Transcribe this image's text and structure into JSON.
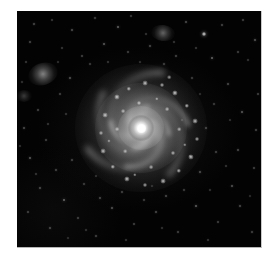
{
  "image": {
    "kind": "astronomical-photograph",
    "subject": "face-on grand-design spiral galaxy",
    "color_mode": "grayscale",
    "caption": "",
    "frame": {
      "left": 17,
      "top": 11,
      "width": 245,
      "height": 237
    },
    "colors": {
      "page_background": "#ffffff",
      "sky_background": "#030303",
      "frame_border": "#c9c9c9",
      "galaxy_light": "#d8d8d8",
      "nucleus": "#ffffff",
      "star": "#ffffff"
    }
  },
  "galaxy": {
    "label": "spiral-galaxy",
    "center": {
      "x": 124,
      "y": 117
    },
    "nucleus_brightness": 1.0,
    "arm_count": 6,
    "winding_direction": "counterclockwise",
    "radius_px": 66,
    "arms": [
      {
        "name": "arm-1",
        "rotation": 8,
        "w": 116,
        "h": 112,
        "thickness": 5.0,
        "opacity": 0.5,
        "sweep": 150,
        "blur": 3.0
      },
      {
        "name": "arm-2",
        "rotation": 72,
        "w": 104,
        "h": 100,
        "thickness": 4.6,
        "opacity": 0.46,
        "sweep": 150,
        "blur": 3.0
      },
      {
        "name": "arm-3",
        "rotation": 140,
        "w": 120,
        "h": 114,
        "thickness": 5.2,
        "opacity": 0.48,
        "sweep": 150,
        "blur": 3.2
      },
      {
        "name": "arm-4",
        "rotation": 205,
        "w": 96,
        "h": 92,
        "thickness": 4.4,
        "opacity": 0.5,
        "sweep": 150,
        "blur": 2.8
      },
      {
        "name": "arm-5",
        "rotation": 268,
        "w": 110,
        "h": 106,
        "thickness": 4.8,
        "opacity": 0.44,
        "sweep": 150,
        "blur": 3.0
      },
      {
        "name": "arm-6",
        "rotation": 320,
        "w": 84,
        "h": 80,
        "thickness": 4.0,
        "opacity": 0.52,
        "sweep": 150,
        "blur": 2.6
      },
      {
        "name": "arm-inner-1",
        "rotation": 30,
        "w": 62,
        "h": 58,
        "thickness": 3.6,
        "opacity": 0.55,
        "sweep": 160,
        "blur": 2.2
      },
      {
        "name": "arm-inner-2",
        "rotation": 212,
        "w": 58,
        "h": 54,
        "thickness": 3.4,
        "opacity": 0.55,
        "sweep": 160,
        "blur": 2.2
      },
      {
        "name": "arm-inner-3",
        "rotation": 118,
        "w": 46,
        "h": 42,
        "thickness": 3.0,
        "opacity": 0.5,
        "sweep": 170,
        "blur": 1.9
      },
      {
        "name": "arm-inner-4",
        "rotation": 300,
        "w": 42,
        "h": 39,
        "thickness": 2.8,
        "opacity": 0.5,
        "sweep": 170,
        "blur": 1.9
      }
    ],
    "knots": [
      {
        "x": 100,
        "y": 86,
        "r": 2.6,
        "b": 0.8
      },
      {
        "x": 112,
        "y": 78,
        "r": 2.2,
        "b": 0.72
      },
      {
        "x": 128,
        "y": 72,
        "r": 2.4,
        "b": 0.78
      },
      {
        "x": 145,
        "y": 74,
        "r": 2.0,
        "b": 0.7
      },
      {
        "x": 158,
        "y": 82,
        "r": 2.6,
        "b": 0.82
      },
      {
        "x": 170,
        "y": 95,
        "r": 2.2,
        "b": 0.74
      },
      {
        "x": 178,
        "y": 110,
        "r": 2.4,
        "b": 0.76
      },
      {
        "x": 180,
        "y": 128,
        "r": 2.0,
        "b": 0.68
      },
      {
        "x": 174,
        "y": 146,
        "r": 2.6,
        "b": 0.78
      },
      {
        "x": 162,
        "y": 160,
        "r": 2.2,
        "b": 0.72
      },
      {
        "x": 146,
        "y": 170,
        "r": 2.4,
        "b": 0.76
      },
      {
        "x": 128,
        "y": 174,
        "r": 2.0,
        "b": 0.68
      },
      {
        "x": 110,
        "y": 168,
        "r": 2.6,
        "b": 0.8
      },
      {
        "x": 96,
        "y": 156,
        "r": 2.2,
        "b": 0.72
      },
      {
        "x": 86,
        "y": 140,
        "r": 2.4,
        "b": 0.74
      },
      {
        "x": 84,
        "y": 122,
        "r": 2.0,
        "b": 0.66
      },
      {
        "x": 88,
        "y": 104,
        "r": 2.4,
        "b": 0.76
      },
      {
        "x": 106,
        "y": 100,
        "r": 1.9,
        "b": 0.66
      },
      {
        "x": 122,
        "y": 92,
        "r": 2.0,
        "b": 0.7
      },
      {
        "x": 150,
        "y": 98,
        "r": 1.9,
        "b": 0.66
      },
      {
        "x": 162,
        "y": 118,
        "r": 1.8,
        "b": 0.64
      },
      {
        "x": 156,
        "y": 142,
        "r": 2.0,
        "b": 0.68
      },
      {
        "x": 134,
        "y": 156,
        "r": 1.9,
        "b": 0.66
      },
      {
        "x": 108,
        "y": 140,
        "r": 1.8,
        "b": 0.62
      },
      {
        "x": 100,
        "y": 118,
        "r": 1.9,
        "b": 0.64
      },
      {
        "x": 140,
        "y": 88,
        "r": 1.7,
        "b": 0.62
      },
      {
        "x": 168,
        "y": 134,
        "r": 1.7,
        "b": 0.6
      },
      {
        "x": 118,
        "y": 164,
        "r": 1.7,
        "b": 0.62
      },
      {
        "x": 92,
        "y": 130,
        "r": 1.6,
        "b": 0.58
      },
      {
        "x": 152,
        "y": 66,
        "r": 1.8,
        "b": 0.62
      }
    ]
  },
  "companions": [
    {
      "name": "fuzzy-galaxy-upper-left",
      "x": 43,
      "y": 74,
      "w": 30,
      "h": 22,
      "opacity": 0.5,
      "rotation": -18
    },
    {
      "name": "fuzzy-galaxy-top",
      "x": 163,
      "y": 33,
      "w": 24,
      "h": 16,
      "opacity": 0.38,
      "rotation": 8
    },
    {
      "name": "fuzzy-patch-left-edge",
      "x": 24,
      "y": 96,
      "w": 16,
      "h": 12,
      "opacity": 0.22,
      "rotation": 0
    }
  ],
  "stars": [
    {
      "x": 34,
      "y": 24,
      "r": 0.9,
      "b": 0.55
    },
    {
      "x": 52,
      "y": 20,
      "r": 0.7,
      "b": 0.4
    },
    {
      "x": 72,
      "y": 30,
      "r": 1.0,
      "b": 0.6
    },
    {
      "x": 95,
      "y": 18,
      "r": 0.8,
      "b": 0.48
    },
    {
      "x": 118,
      "y": 27,
      "r": 1.3,
      "b": 0.78
    },
    {
      "x": 131,
      "y": 16,
      "r": 0.7,
      "b": 0.42
    },
    {
      "x": 186,
      "y": 22,
      "r": 1.0,
      "b": 0.6
    },
    {
      "x": 204,
      "y": 34,
      "r": 1.6,
      "b": 0.88
    },
    {
      "x": 222,
      "y": 25,
      "r": 0.9,
      "b": 0.52
    },
    {
      "x": 243,
      "y": 20,
      "r": 0.8,
      "b": 0.46
    },
    {
      "x": 255,
      "y": 40,
      "r": 1.1,
      "b": 0.66
    },
    {
      "x": 238,
      "y": 52,
      "r": 0.8,
      "b": 0.46
    },
    {
      "x": 212,
      "y": 58,
      "r": 1.4,
      "b": 0.8
    },
    {
      "x": 196,
      "y": 48,
      "r": 0.7,
      "b": 0.4
    },
    {
      "x": 176,
      "y": 56,
      "r": 0.9,
      "b": 0.52
    },
    {
      "x": 150,
      "y": 46,
      "r": 1.0,
      "b": 0.58
    },
    {
      "x": 128,
      "y": 52,
      "r": 0.8,
      "b": 0.46
    },
    {
      "x": 104,
      "y": 44,
      "r": 1.2,
      "b": 0.7
    },
    {
      "x": 82,
      "y": 56,
      "r": 0.8,
      "b": 0.46
    },
    {
      "x": 62,
      "y": 48,
      "r": 0.7,
      "b": 0.4
    },
    {
      "x": 30,
      "y": 42,
      "r": 1.0,
      "b": 0.56
    },
    {
      "x": 26,
      "y": 62,
      "r": 0.7,
      "b": 0.4
    },
    {
      "x": 70,
      "y": 78,
      "r": 1.1,
      "b": 0.64
    },
    {
      "x": 60,
      "y": 94,
      "r": 0.8,
      "b": 0.46
    },
    {
      "x": 38,
      "y": 110,
      "r": 0.9,
      "b": 0.52
    },
    {
      "x": 24,
      "y": 128,
      "r": 1.0,
      "b": 0.58
    },
    {
      "x": 46,
      "y": 140,
      "r": 0.8,
      "b": 0.46
    },
    {
      "x": 30,
      "y": 158,
      "r": 1.2,
      "b": 0.7
    },
    {
      "x": 56,
      "y": 170,
      "r": 0.9,
      "b": 0.52
    },
    {
      "x": 40,
      "y": 188,
      "r": 1.0,
      "b": 0.58
    },
    {
      "x": 64,
      "y": 200,
      "r": 1.4,
      "b": 0.8
    },
    {
      "x": 28,
      "y": 212,
      "r": 0.8,
      "b": 0.46
    },
    {
      "x": 50,
      "y": 228,
      "r": 1.0,
      "b": 0.56
    },
    {
      "x": 78,
      "y": 218,
      "r": 0.8,
      "b": 0.46
    },
    {
      "x": 96,
      "y": 236,
      "r": 0.9,
      "b": 0.5
    },
    {
      "x": 112,
      "y": 208,
      "r": 1.1,
      "b": 0.64
    },
    {
      "x": 134,
      "y": 224,
      "r": 0.8,
      "b": 0.46
    },
    {
      "x": 156,
      "y": 212,
      "r": 1.0,
      "b": 0.58
    },
    {
      "x": 178,
      "y": 232,
      "r": 0.9,
      "b": 0.5
    },
    {
      "x": 196,
      "y": 206,
      "r": 1.3,
      "b": 0.76
    },
    {
      "x": 218,
      "y": 222,
      "r": 0.8,
      "b": 0.46
    },
    {
      "x": 240,
      "y": 206,
      "r": 1.0,
      "b": 0.58
    },
    {
      "x": 252,
      "y": 232,
      "r": 0.9,
      "b": 0.5
    },
    {
      "x": 232,
      "y": 186,
      "r": 1.1,
      "b": 0.64
    },
    {
      "x": 254,
      "y": 168,
      "r": 0.8,
      "b": 0.46
    },
    {
      "x": 238,
      "y": 150,
      "r": 1.0,
      "b": 0.58
    },
    {
      "x": 256,
      "y": 130,
      "r": 0.9,
      "b": 0.52
    },
    {
      "x": 242,
      "y": 112,
      "r": 1.2,
      "b": 0.7
    },
    {
      "x": 258,
      "y": 94,
      "r": 0.8,
      "b": 0.46
    },
    {
      "x": 228,
      "y": 84,
      "r": 1.0,
      "b": 0.58
    },
    {
      "x": 214,
      "y": 104,
      "r": 0.8,
      "b": 0.44
    },
    {
      "x": 206,
      "y": 128,
      "r": 1.0,
      "b": 0.56
    },
    {
      "x": 216,
      "y": 152,
      "r": 0.9,
      "b": 0.5
    },
    {
      "x": 200,
      "y": 172,
      "r": 1.1,
      "b": 0.62
    },
    {
      "x": 184,
      "y": 190,
      "r": 0.8,
      "b": 0.44
    },
    {
      "x": 166,
      "y": 196,
      "r": 1.0,
      "b": 0.56
    },
    {
      "x": 144,
      "y": 200,
      "r": 0.8,
      "b": 0.44
    },
    {
      "x": 122,
      "y": 192,
      "r": 0.9,
      "b": 0.5
    },
    {
      "x": 100,
      "y": 198,
      "r": 1.0,
      "b": 0.56
    },
    {
      "x": 84,
      "y": 184,
      "r": 0.8,
      "b": 0.44
    },
    {
      "x": 72,
      "y": 160,
      "r": 0.9,
      "b": 0.5
    },
    {
      "x": 90,
      "y": 64,
      "r": 0.8,
      "b": 0.44
    },
    {
      "x": 164,
      "y": 64,
      "r": 0.9,
      "b": 0.5
    },
    {
      "x": 192,
      "y": 78,
      "r": 0.8,
      "b": 0.44
    },
    {
      "x": 146,
      "y": 34,
      "r": 0.7,
      "b": 0.38
    },
    {
      "x": 174,
      "y": 42,
      "r": 0.7,
      "b": 0.38
    },
    {
      "x": 108,
      "y": 62,
      "r": 0.7,
      "b": 0.38
    },
    {
      "x": 48,
      "y": 124,
      "r": 0.7,
      "b": 0.38
    },
    {
      "x": 66,
      "y": 114,
      "r": 0.7,
      "b": 0.38
    },
    {
      "x": 36,
      "y": 174,
      "r": 0.7,
      "b": 0.38
    },
    {
      "x": 126,
      "y": 240,
      "r": 0.7,
      "b": 0.38
    },
    {
      "x": 208,
      "y": 240,
      "r": 0.7,
      "b": 0.38
    },
    {
      "x": 248,
      "y": 60,
      "r": 0.7,
      "b": 0.38
    },
    {
      "x": 226,
      "y": 166,
      "r": 0.7,
      "b": 0.38
    },
    {
      "x": 190,
      "y": 156,
      "r": 0.7,
      "b": 0.36
    },
    {
      "x": 210,
      "y": 190,
      "r": 0.7,
      "b": 0.36
    },
    {
      "x": 86,
      "y": 230,
      "r": 0.7,
      "b": 0.36
    },
    {
      "x": 162,
      "y": 228,
      "r": 0.7,
      "b": 0.36
    },
    {
      "x": 22,
      "y": 82,
      "r": 0.7,
      "b": 0.36
    },
    {
      "x": 58,
      "y": 62,
      "r": 0.6,
      "b": 0.32
    },
    {
      "x": 140,
      "y": 62,
      "r": 0.6,
      "b": 0.32
    },
    {
      "x": 182,
      "y": 120,
      "r": 0.6,
      "b": 0.32
    },
    {
      "x": 96,
      "y": 176,
      "r": 0.6,
      "b": 0.32
    },
    {
      "x": 152,
      "y": 186,
      "r": 0.6,
      "b": 0.32
    },
    {
      "x": 230,
      "y": 120,
      "r": 0.6,
      "b": 0.32
    },
    {
      "x": 20,
      "y": 146,
      "r": 0.6,
      "b": 0.32
    },
    {
      "x": 68,
      "y": 238,
      "r": 0.6,
      "b": 0.3
    },
    {
      "x": 200,
      "y": 94,
      "r": 0.6,
      "b": 0.3
    },
    {
      "x": 250,
      "y": 196,
      "r": 0.6,
      "b": 0.3
    }
  ]
}
